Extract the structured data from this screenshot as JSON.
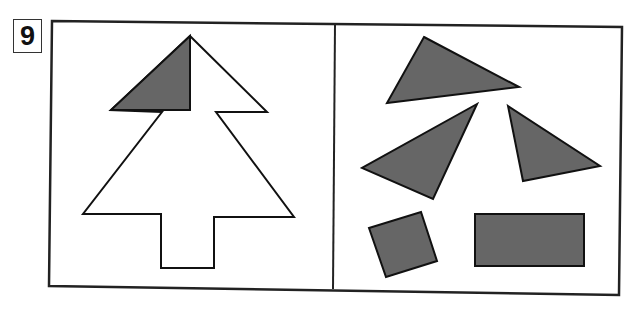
{
  "puzzle": {
    "number": "9",
    "colors": {
      "fill": "#666666",
      "stroke": "#111111",
      "background": "#ffffff"
    },
    "left_panel": {
      "description": "Tree outline with one shaded triangle placed at the top-left",
      "outline_points": "190,36 267,112 216,112 294,217 214,217 214,268 161,268 161,214 83,214 162,112 111,110",
      "placed_piece_points": "190,36 190,110 111,110"
    },
    "right_panel": {
      "description": "Loose pieces to fit into the tree",
      "pieces": [
        {
          "id": "triangle-1",
          "points": "424,37 519,87 387,103"
        },
        {
          "id": "triangle-2",
          "points": "477,104 362,168 433,199"
        },
        {
          "id": "triangle-3",
          "points": "508,106 600,166 523,181"
        },
        {
          "id": "square",
          "points": "369,228 421,212 437,261 386,277"
        },
        {
          "id": "rectangle",
          "points": "475,214 584,214 584,266 475,266"
        }
      ]
    },
    "frame": {
      "outer_points": "52,21 622,27 619,295 49,286",
      "divider": {
        "x1": 335,
        "y1": 24,
        "x2": 333,
        "y2": 289
      }
    }
  }
}
